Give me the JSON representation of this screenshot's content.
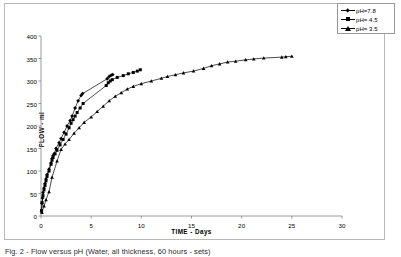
{
  "figure": {
    "caption": "Fig. 2 - Flow versus pH  (Water, all thickness, 60 hours - sets)"
  },
  "legend": {
    "position": "top-right",
    "entries": [
      {
        "label": "pH=7.8",
        "marker": "diamond",
        "color": "#000000"
      },
      {
        "label": "pH= 4.5",
        "marker": "square",
        "color": "#000000"
      },
      {
        "label": "pH= 3.5",
        "marker": "triangle",
        "color": "#000000"
      }
    ]
  },
  "chart_data": {
    "type": "line",
    "title": "",
    "xlabel": "TIME  -  Days",
    "ylabel": "FLOW  -  ml",
    "xlim": [
      0,
      30
    ],
    "ylim": [
      0,
      400
    ],
    "xticks": [
      0,
      5,
      10,
      15,
      20,
      25,
      30
    ],
    "yticks": [
      0,
      50,
      100,
      150,
      200,
      250,
      300,
      350,
      400
    ],
    "grid": false,
    "axis_color": "#808080",
    "series": [
      {
        "name": "pH=7.8",
        "marker": "diamond",
        "color": "#000000",
        "points": [
          [
            0.05,
            10
          ],
          [
            0.1,
            28
          ],
          [
            0.15,
            40
          ],
          [
            0.2,
            52
          ],
          [
            0.3,
            62
          ],
          [
            0.4,
            72
          ],
          [
            0.5,
            82
          ],
          [
            0.6,
            92
          ],
          [
            0.8,
            104
          ],
          [
            1.0,
            118
          ],
          [
            1.1,
            128
          ],
          [
            1.2,
            134
          ],
          [
            1.3,
            138
          ],
          [
            1.5,
            150
          ],
          [
            1.8,
            163
          ],
          [
            2.0,
            172
          ],
          [
            2.3,
            186
          ],
          [
            2.6,
            200
          ],
          [
            2.9,
            212
          ],
          [
            3.1,
            222
          ],
          [
            3.4,
            240
          ],
          [
            3.7,
            256
          ],
          [
            4.0,
            268
          ],
          [
            4.15,
            272
          ],
          [
            6.6,
            305
          ],
          [
            6.8,
            310
          ],
          [
            7.0,
            313
          ],
          [
            7.15,
            314
          ]
        ]
      },
      {
        "name": "pH= 4.5",
        "marker": "square",
        "color": "#000000",
        "points": [
          [
            0.05,
            12
          ],
          [
            0.1,
            30
          ],
          [
            0.2,
            45
          ],
          [
            0.3,
            58
          ],
          [
            0.4,
            68
          ],
          [
            0.5,
            78
          ],
          [
            0.6,
            88
          ],
          [
            0.8,
            100
          ],
          [
            1.0,
            115
          ],
          [
            1.1,
            124
          ],
          [
            1.2,
            130
          ],
          [
            1.4,
            138
          ],
          [
            1.6,
            146
          ],
          [
            1.9,
            158
          ],
          [
            2.2,
            170
          ],
          [
            2.5,
            182
          ],
          [
            2.8,
            196
          ],
          [
            3.0,
            206
          ],
          [
            3.2,
            214
          ],
          [
            3.4,
            222
          ],
          [
            3.6,
            230
          ],
          [
            3.9,
            240
          ],
          [
            4.2,
            250
          ],
          [
            6.5,
            290
          ],
          [
            6.7,
            296
          ],
          [
            6.9,
            300
          ],
          [
            7.1,
            303
          ],
          [
            7.6,
            308
          ],
          [
            8.2,
            312
          ],
          [
            8.7,
            316
          ],
          [
            9.2,
            319
          ],
          [
            9.6,
            322
          ],
          [
            9.9,
            325
          ]
        ]
      },
      {
        "name": "pH= 3.5",
        "marker": "triangle",
        "color": "#000000",
        "points": [
          [
            0.1,
            8
          ],
          [
            0.3,
            22
          ],
          [
            0.5,
            36
          ],
          [
            0.8,
            54
          ],
          [
            1.1,
            86
          ],
          [
            1.6,
            122
          ],
          [
            2.0,
            148
          ],
          [
            2.4,
            160
          ],
          [
            2.8,
            170
          ],
          [
            3.3,
            184
          ],
          [
            3.8,
            196
          ],
          [
            4.3,
            208
          ],
          [
            5.0,
            220
          ],
          [
            5.6,
            232
          ],
          [
            6.2,
            244
          ],
          [
            6.8,
            256
          ],
          [
            7.4,
            266
          ],
          [
            8.0,
            274
          ],
          [
            8.6,
            282
          ],
          [
            9.2,
            288
          ],
          [
            10.0,
            294
          ],
          [
            11.0,
            300
          ],
          [
            12.0,
            306
          ],
          [
            12.6,
            310
          ],
          [
            13.4,
            314
          ],
          [
            14.2,
            318
          ],
          [
            15.2,
            322
          ],
          [
            16.2,
            328
          ],
          [
            17.0,
            334
          ],
          [
            17.8,
            338
          ],
          [
            18.6,
            342
          ],
          [
            19.4,
            344
          ],
          [
            20.4,
            347
          ],
          [
            21.2,
            349
          ],
          [
            22.2,
            351
          ],
          [
            24.0,
            353
          ],
          [
            24.4,
            354
          ],
          [
            25.0,
            355
          ]
        ]
      }
    ]
  }
}
